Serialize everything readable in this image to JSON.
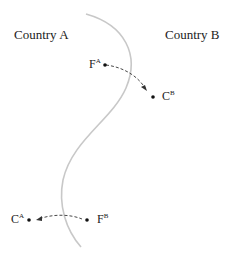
{
  "countries": {
    "a": "Country A",
    "b": "Country B"
  },
  "points": {
    "fa": {
      "main": "F",
      "sup": "A"
    },
    "cb": {
      "main": "C",
      "sup": "B"
    },
    "ca": {
      "main": "C",
      "sup": "A"
    },
    "fb": {
      "main": "F",
      "sup": "B"
    }
  },
  "colors": {
    "border": "#c8c8c8",
    "ink": "#222222"
  }
}
